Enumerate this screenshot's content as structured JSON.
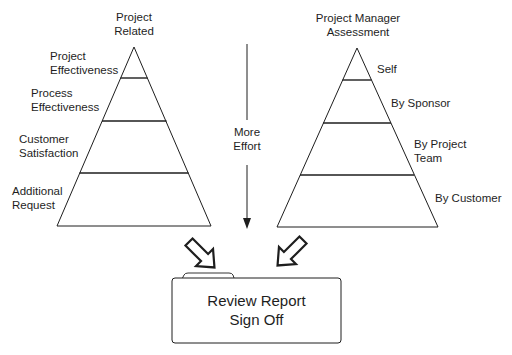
{
  "left_pyramid": {
    "title": "Project\nRelated",
    "levels": [
      {
        "label": "Project\nEffectiveness"
      },
      {
        "label": "Process\nEffectiveness"
      },
      {
        "label": "Customer\nSatisfaction"
      },
      {
        "label": "Additional\nRequest"
      }
    ]
  },
  "right_pyramid": {
    "title": "Project Manager\nAssessment",
    "levels": [
      {
        "label": "Self"
      },
      {
        "label": "By Sponsor"
      },
      {
        "label": "By Project\nTeam"
      },
      {
        "label": "By Customer"
      }
    ]
  },
  "effort_arrow": {
    "label": "More\nEffort"
  },
  "result_box": {
    "label": "Review Report\nSign Off"
  },
  "colors": {
    "line": "#1e1e1e",
    "background": "#ffffff"
  }
}
